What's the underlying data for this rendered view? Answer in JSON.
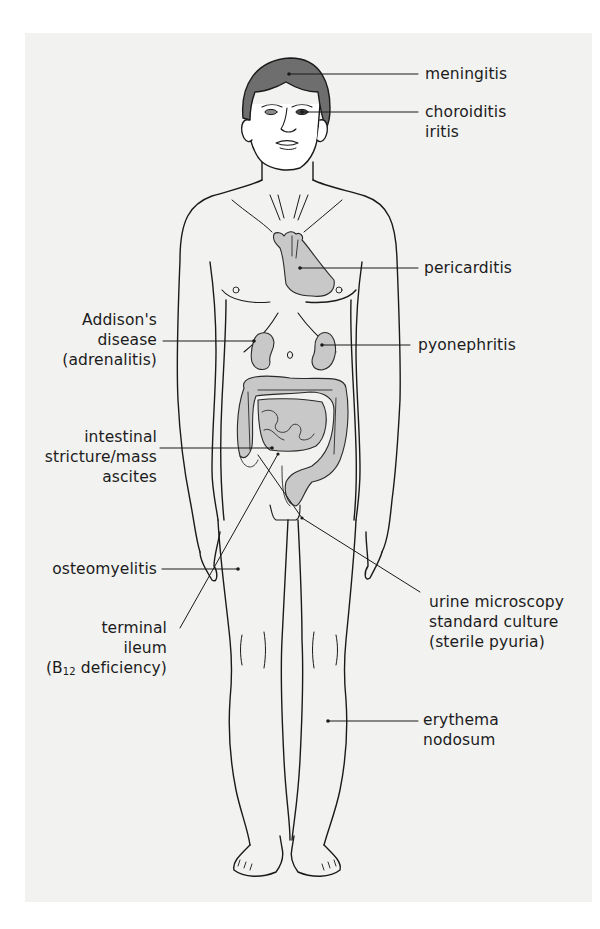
{
  "figure": {
    "panel_color": "#f2f2f1",
    "organ_fill": "#c8c8c8",
    "hair_fill": "#6e6e6e",
    "line_color": "#1a1a1a"
  },
  "labels": {
    "meningitis": {
      "lines": [
        "meningitis"
      ]
    },
    "eye": {
      "lines": [
        "choroiditis",
        "iritis"
      ]
    },
    "pericarditis": {
      "lines": [
        "pericarditis"
      ]
    },
    "addisons": {
      "lines": [
        "Addison's",
        "disease",
        "(adrenalitis)"
      ]
    },
    "pyonephritis": {
      "lines": [
        "pyonephritis"
      ]
    },
    "intestinal": {
      "lines": [
        "intestinal",
        "stricture/mass",
        "ascites"
      ]
    },
    "osteomyelitis": {
      "lines": [
        "osteomyelitis"
      ]
    },
    "terminal_ileum": {
      "lines": [
        "terminal",
        "ileum"
      ],
      "b12_prefix": "(B",
      "b12_sub": "12",
      "b12_suffix": " deficiency)"
    },
    "urine": {
      "lines": [
        "urine microscopy",
        "standard culture",
        "(sterile pyuria)"
      ]
    },
    "erythema": {
      "lines": [
        "erythema",
        "nodosum"
      ]
    }
  }
}
